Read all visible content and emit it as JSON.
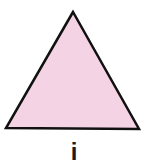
{
  "figure": {
    "shape": "triangle",
    "fill_color": "#f4d4e4",
    "stroke_color": "#111111",
    "vertices": [
      [
        73,
        12
      ],
      [
        6,
        128
      ],
      [
        139,
        129
      ]
    ],
    "label": "i"
  }
}
